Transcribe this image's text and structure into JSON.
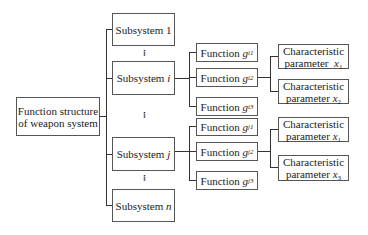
{
  "diagram": {
    "root": {
      "label_line1": "Function structure",
      "label_line2": "of weapon system"
    },
    "subsystems": [
      {
        "prefix": "Subsystem",
        "index": "1"
      },
      {
        "prefix": "Subsystem",
        "index": "i"
      },
      {
        "prefix": "Subsystem",
        "index": "j"
      },
      {
        "prefix": "Subsystem",
        "index": "n"
      }
    ],
    "ellipsis": "⁝",
    "functions_i": [
      {
        "prefix": "Function",
        "symbol": "g",
        "sub": "i1"
      },
      {
        "prefix": "Function",
        "symbol": "g",
        "sub": "i2"
      },
      {
        "prefix": "Function",
        "symbol": "g",
        "sub": "i3"
      }
    ],
    "functions_j": [
      {
        "prefix": "Function",
        "symbol": "g",
        "sub": "j1"
      },
      {
        "prefix": "Function",
        "symbol": "g",
        "sub": "j2"
      },
      {
        "prefix": "Function",
        "symbol": "g",
        "sub": "j3"
      }
    ],
    "params_i": [
      {
        "line1": "Characteristic",
        "line2": "parameter",
        "symbol": "x",
        "sub": "1"
      },
      {
        "line1": "Characteristic",
        "line2": "parameter",
        "symbol": "x",
        "sub": "2"
      }
    ],
    "params_j": [
      {
        "line1": "Characteristic",
        "line2": "parameter",
        "symbol": "x",
        "sub": "1"
      },
      {
        "line1": "Characteristic",
        "line2": "parameter",
        "symbol": "x",
        "sub": "3"
      }
    ]
  }
}
